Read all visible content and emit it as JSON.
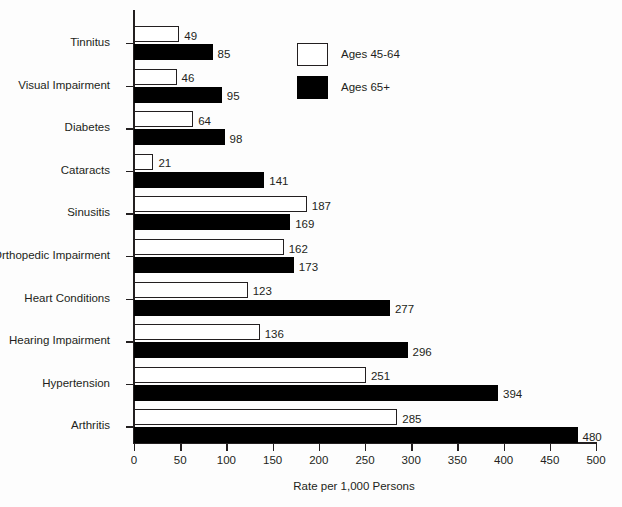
{
  "chart_data": {
    "type": "bar",
    "orientation": "horizontal",
    "title": "",
    "xlabel": "Rate per 1,000 Persons",
    "ylabel": "",
    "xlim": [
      0,
      500
    ],
    "xticks": [
      0,
      50,
      100,
      150,
      200,
      250,
      300,
      350,
      400,
      450,
      500
    ],
    "grid": false,
    "legend_position": "top-right",
    "categories": [
      "Tinnitus",
      "Visual Impairment",
      "Diabetes",
      "Cataracts",
      "Sinusitis",
      "Orthopedic Impairment",
      "Heart Conditions",
      "Hearing Impairment",
      "Hypertension",
      "Arthritis"
    ],
    "series": [
      {
        "name": "Ages 45-64",
        "color": "#ffffff",
        "edge_color": "#231f20",
        "values": [
          49,
          46,
          64,
          21,
          187,
          162,
          123,
          136,
          251,
          285
        ]
      },
      {
        "name": "Ages 65+",
        "color": "#000000",
        "edge_color": "#000000",
        "values": [
          85,
          95,
          98,
          141,
          169,
          173,
          277,
          296,
          394,
          480
        ]
      }
    ]
  },
  "legend": {
    "items": [
      {
        "label": "Ages 45-64",
        "swatch": "light"
      },
      {
        "label": "Ages 65+",
        "swatch": "dark"
      }
    ]
  },
  "axis": {
    "x_title": "Rate per 1,000 Persons",
    "tick_labels": [
      "0",
      "50",
      "100",
      "150",
      "200",
      "250",
      "300",
      "350",
      "400",
      "450",
      "500"
    ]
  },
  "colors": {
    "ink": "#231f20",
    "series_light": "#ffffff",
    "series_dark": "#000000",
    "background": "#fdfdfd"
  }
}
